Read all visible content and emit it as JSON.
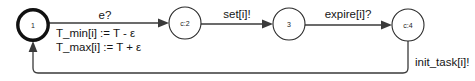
{
  "diagram": {
    "type": "timed-automaton",
    "colors": {
      "background": "#ffffff",
      "stroke": "#3a3a3a",
      "initial_state_stroke": "#111111",
      "text": "#151515"
    },
    "states": [
      {
        "id": "s1",
        "label": "1",
        "kind": "initial",
        "cx": 33,
        "cy": 25,
        "r": 16
      },
      {
        "id": "s2",
        "label": "c:2",
        "kind": "committed",
        "cx": 185,
        "cy": 23,
        "r": 16
      },
      {
        "id": "s3",
        "label": "3",
        "kind": "normal",
        "cx": 289,
        "cy": 24,
        "r": 16
      },
      {
        "id": "s4",
        "label": "c:4",
        "kind": "committed",
        "cx": 408,
        "cy": 25,
        "r": 16
      }
    ],
    "transitions": [
      {
        "id": "t1",
        "from": "s1",
        "to": "s2",
        "sync": "e?",
        "assignments": [
          "T_min[i] := T - ε",
          "T_max[i] := T + ε"
        ]
      },
      {
        "id": "t2",
        "from": "s2",
        "to": "s3",
        "sync": "set[i]!",
        "assignments": []
      },
      {
        "id": "t3",
        "from": "s3",
        "to": "s4",
        "sync": "expire[i]?",
        "assignments": []
      },
      {
        "id": "t4",
        "from": "s4",
        "to": "s1",
        "sync": "init_task[i]!",
        "assignments": []
      }
    ]
  }
}
